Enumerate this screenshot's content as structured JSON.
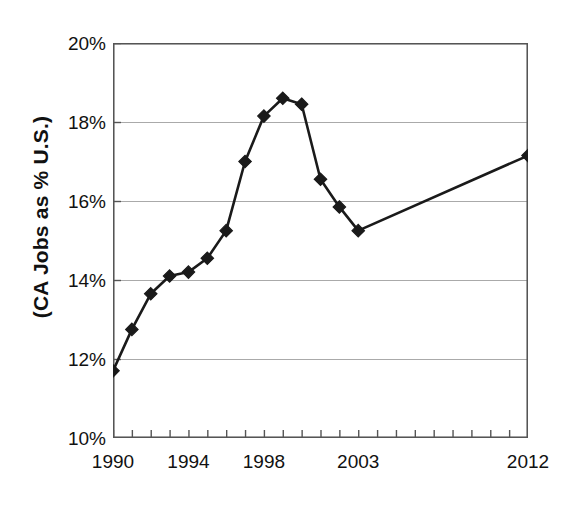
{
  "chart_data": {
    "type": "line",
    "title": "",
    "xlabel": "",
    "ylabel": "(CA Jobs as % U.S.)",
    "x": [
      1990,
      1991,
      1992,
      1993,
      1994,
      1995,
      1996,
      1997,
      1998,
      1999,
      2000,
      2001,
      2002,
      2003,
      2012
    ],
    "values": [
      11.7,
      12.75,
      13.65,
      14.1,
      14.2,
      14.55,
      15.25,
      17.0,
      18.15,
      18.6,
      18.45,
      16.55,
      15.85,
      15.25,
      17.15
    ],
    "series": [
      {
        "name": "CA Jobs as % U.S.",
        "values": [
          11.7,
          12.75,
          13.65,
          14.1,
          14.2,
          14.55,
          15.25,
          17.0,
          18.15,
          18.6,
          18.45,
          16.55,
          15.85,
          15.25,
          17.15
        ]
      }
    ],
    "ylim": [
      10,
      20
    ],
    "xlim": [
      1990,
      2012
    ],
    "ytick_values": [
      10,
      12,
      14,
      16,
      18,
      20
    ],
    "ytick_labels": [
      "10%",
      "12%",
      "14%",
      "16%",
      "18%",
      "20%"
    ],
    "xtick_values": [
      1990,
      1991,
      1992,
      1993,
      1994,
      1995,
      1996,
      1997,
      1998,
      1999,
      2000,
      2001,
      2002,
      2003,
      2004,
      2005,
      2006,
      2007,
      2008,
      2009,
      2010,
      2011,
      2012
    ],
    "xtick_labels_shown": [
      {
        "value": 1990,
        "label": "1990"
      },
      {
        "value": 1994,
        "label": "1994"
      },
      {
        "value": 1998,
        "label": "1998"
      },
      {
        "value": 2003,
        "label": "2003"
      },
      {
        "value": 2012,
        "label": "2012"
      }
    ],
    "grid": "horizontal",
    "legend": "none",
    "marker": "diamond",
    "marker_color": "#1a1a1a",
    "line_color": "#1a1a1a",
    "axis_color": "#555555",
    "gridline_color": "#aaaaaa",
    "background": "#ffffff"
  },
  "axes": {
    "y_title": "(CA Jobs as % U.S.)"
  }
}
